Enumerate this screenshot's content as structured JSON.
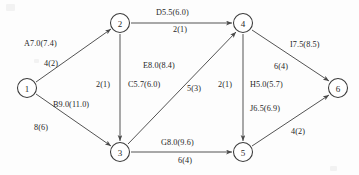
{
  "diagram": {
    "background_color": "#fdfdfd",
    "line_color": "#4a4a4a",
    "text_color": "#262626",
    "nodes": [
      {
        "id": "1",
        "label": "1",
        "cx": 27,
        "cy": 88
      },
      {
        "id": "2",
        "label": "2",
        "cx": 120,
        "cy": 23
      },
      {
        "id": "3",
        "label": "3",
        "cx": 120,
        "cy": 152
      },
      {
        "id": "4",
        "label": "4",
        "cx": 243,
        "cy": 23
      },
      {
        "id": "5",
        "label": "5",
        "cx": 243,
        "cy": 152
      },
      {
        "id": "6",
        "label": "6",
        "cx": 338,
        "cy": 88
      }
    ],
    "edges": [
      {
        "id": "A",
        "from": "1",
        "to": "2",
        "primary": "A7.0(7.4)",
        "secondary": "4(2)",
        "px": 24,
        "py": 40,
        "sx": 44,
        "py2": 60
      },
      {
        "id": "B",
        "from": "1",
        "to": "3",
        "primary": "B9.0(11.0)",
        "secondary": "8(6)",
        "px": 53,
        "py": 101,
        "sx": 34,
        "py2": 124
      },
      {
        "id": "D",
        "from": "2",
        "to": "4",
        "primary": "D5.5(6.0)",
        "secondary": "2(1)",
        "px": 156,
        "py": 9,
        "sx": 173,
        "py2": 26
      },
      {
        "id": "C",
        "from": "2",
        "to": "3",
        "primary": "C5.7(6.0)",
        "secondary": "2(1)",
        "px": 128,
        "py": 81,
        "sx": 96,
        "py2": 81
      },
      {
        "id": "E",
        "from": "3",
        "to": "4",
        "primary": "E8.0(8.4)",
        "secondary": "5(3)",
        "px": 143,
        "py": 62,
        "sx": 187,
        "py2": 85
      },
      {
        "id": "G",
        "from": "3",
        "to": "5",
        "primary": "G8.0(9.6)",
        "secondary": "6(4)",
        "px": 161,
        "py": 139,
        "sx": 178,
        "py2": 157
      },
      {
        "id": "H",
        "from": "4",
        "to": "5",
        "primary": "H5.0(5.7)",
        "secondary": "2(1)",
        "px": 250,
        "py": 81,
        "sx": 218,
        "py2": 81
      },
      {
        "id": "I",
        "from": "4",
        "to": "6",
        "primary": "I7.5(8.5)",
        "secondary": "6(4)",
        "px": 290,
        "py": 41,
        "sx": 274,
        "py2": 63
      },
      {
        "id": "J",
        "from": "5",
        "to": "6",
        "primary": "J6.5(6.9)",
        "secondary": "4(2)",
        "px": 250,
        "py": 105,
        "sx": 291,
        "py2": 128
      }
    ]
  }
}
